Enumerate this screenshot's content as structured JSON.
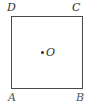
{
  "figure": {
    "type": "geometry-diagram",
    "shape": "square",
    "background_color": "#ffffff",
    "stroke_color": "#4a4a4a",
    "label_color": "#2e2e2e",
    "vertices": {
      "top_left": "D",
      "top_right": "C",
      "bottom_left": "A",
      "bottom_right": "B"
    },
    "center": {
      "label": "O",
      "marker": "dot"
    }
  }
}
